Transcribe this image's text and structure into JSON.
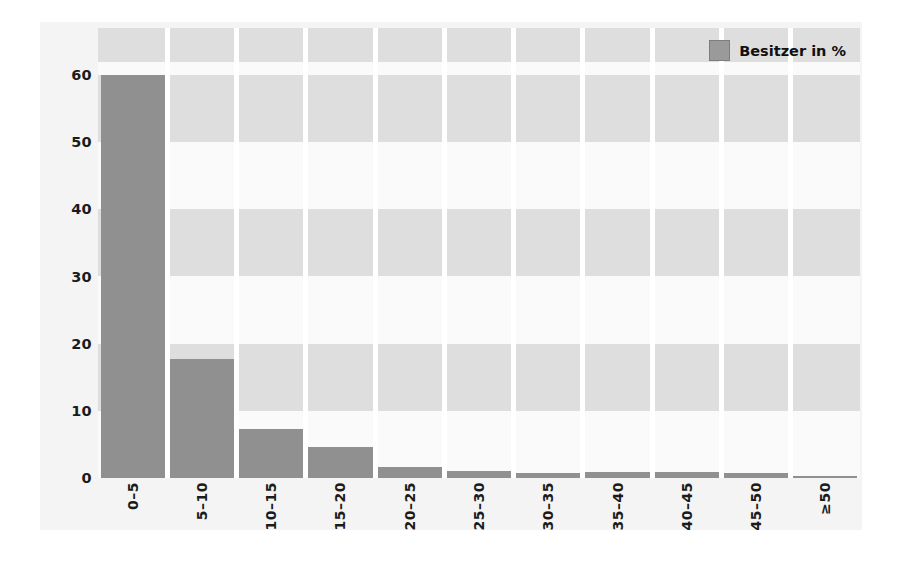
{
  "chart_data": {
    "type": "bar",
    "title": "",
    "subtitle": "",
    "xlabel": "",
    "ylabel": "",
    "categories": [
      "0–5",
      "5–10",
      "10–15",
      "15–20",
      "20–25",
      "25–30",
      "30–35",
      "35–40",
      "40–45",
      "45–50",
      "≥50"
    ],
    "values": [
      60.0,
      17.7,
      7.3,
      4.6,
      1.7,
      1.0,
      0.8,
      0.9,
      0.9,
      0.7,
      0.3
    ],
    "series": [
      {
        "name": "Besitzer in %",
        "values": [
          60.0,
          17.7,
          7.3,
          4.6,
          1.7,
          1.0,
          0.8,
          0.9,
          0.9,
          0.7,
          0.3
        ]
      }
    ],
    "ylim": [
      0,
      67
    ],
    "yticks": [
      0,
      10,
      20,
      30,
      40,
      50,
      60
    ],
    "ytick_labels": [
      "0",
      "10",
      "20",
      "30",
      "40",
      "50",
      "60"
    ],
    "grid": "horizontal-bands",
    "band_ranges": [
      [
        10,
        20
      ],
      [
        30,
        40
      ],
      [
        50,
        60
      ],
      [
        62,
        67
      ]
    ],
    "legend": {
      "position": "top-right",
      "entries": [
        {
          "label": "Besitzer in %",
          "color": "#9a9a9a"
        }
      ]
    },
    "colors": {
      "bar": "#909090",
      "band": "#dedede",
      "plot_background": "#fafafa",
      "panel_background": "#f4f4f4",
      "page_background": "#ffffff",
      "text": "#1b1b1b"
    },
    "xtick_rotation": 90
  }
}
